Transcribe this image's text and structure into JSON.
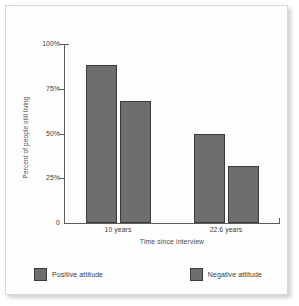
{
  "chart_data": {
    "type": "bar",
    "title": "",
    "xlabel": "Time since interview",
    "ylabel": "Percent of people still living",
    "categories": [
      "10 years",
      "22.6 years"
    ],
    "series": [
      {
        "name": "Positive attitude",
        "values": [
          88,
          50
        ],
        "color": "#6e6e6e"
      },
      {
        "name": "Negative attitude",
        "values": [
          68,
          32
        ],
        "color": "#6e6e6e"
      }
    ],
    "ylim": [
      0,
      100
    ],
    "yticks": [
      0,
      25,
      50,
      75,
      100
    ],
    "ytick_labels": [
      "0",
      "25%",
      "50%",
      "75%",
      "100%"
    ],
    "grid": false,
    "legend_position": "bottom",
    "bar_edge_color": "#3a3a3a",
    "axis_color": "#5d5d5d"
  },
  "legend": {
    "entries": [
      {
        "label": "Positive attitude",
        "swatch_name": "legend-swatch-positive"
      },
      {
        "label": "Negative attitude",
        "swatch_name": "legend-swatch-negative"
      }
    ]
  }
}
